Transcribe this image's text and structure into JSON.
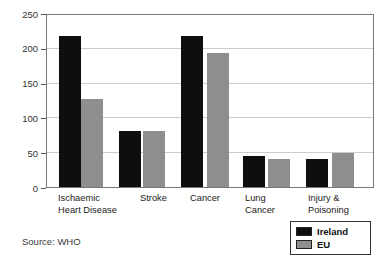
{
  "chart_data": {
    "type": "bar",
    "title": "",
    "xlabel": "",
    "ylabel": "",
    "categories": [
      "Ischaemic Heart Disease",
      "Stroke",
      "Cancer",
      "Lung Cancer",
      "Injury & Poisoning"
    ],
    "category_label_lines": [
      [
        "Ischaemic",
        "Heart Disease"
      ],
      [
        "Stroke"
      ],
      [
        "Cancer"
      ],
      [
        "Lung",
        "Cancer"
      ],
      [
        "Injury &",
        "Poisoning"
      ]
    ],
    "series": [
      {
        "name": "Ireland",
        "color": "#0e0e0e",
        "values": [
          220,
          82,
          220,
          45,
          41
        ]
      },
      {
        "name": "EU",
        "color": "#8e8e8e",
        "values": [
          128,
          82,
          195,
          40,
          50
        ]
      }
    ],
    "ylim": [
      0,
      250
    ],
    "yticks": [
      0,
      50,
      100,
      150,
      200,
      250
    ],
    "grid": true,
    "legend_position": "bottom-right"
  },
  "legend": {
    "items": [
      {
        "label": "Ireland",
        "color": "#0e0e0e"
      },
      {
        "label": "EU",
        "color": "#8e8e8e"
      }
    ]
  },
  "source": {
    "label": "Source: WHO"
  }
}
